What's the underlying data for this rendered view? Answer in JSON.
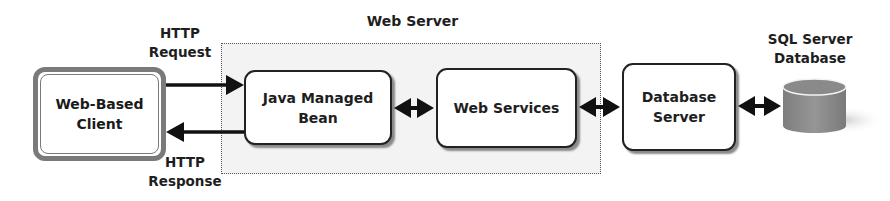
{
  "diagram": {
    "title": "Web Server",
    "nodes": {
      "client": {
        "label": "Web-Based Client",
        "line1": "Web-Based",
        "line2": "Client"
      },
      "java_bean": {
        "label": "Java Managed Bean",
        "line1": "Java Managed",
        "line2": "Bean"
      },
      "web_services": {
        "label": "Web Services"
      },
      "db_server": {
        "label": "Database Server",
        "line1": "Database",
        "line2": "Server"
      },
      "sql_db": {
        "label": "SQL Server Database",
        "line1": "SQL Server",
        "line2": "Database"
      }
    },
    "edges": {
      "request": {
        "line1": "HTTP",
        "line2": "Request"
      },
      "response": {
        "line1": "HTTP",
        "line2": "Response"
      }
    },
    "colors": {
      "client_border": "#7a7a7a",
      "region_bg": "#f3f3f3",
      "cylinder": "#8c8c8c",
      "arrow": "#111111"
    }
  }
}
